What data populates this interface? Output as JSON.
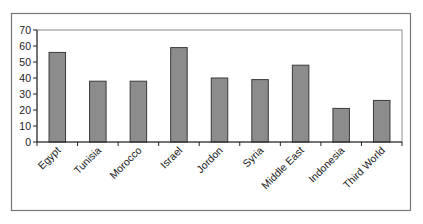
{
  "chart_data": {
    "type": "bar",
    "title": "",
    "xlabel": "",
    "ylabel": "",
    "categories": [
      "Egypt",
      "Tunisia",
      "Morocco",
      "Israel",
      "Jordon",
      "Syria",
      "Middle East",
      "Indonesia",
      "Third World"
    ],
    "values": [
      56,
      38,
      38,
      59,
      40,
      39,
      48,
      21,
      26
    ],
    "ylim": [
      0,
      70
    ],
    "yticks": [
      0,
      10,
      20,
      30,
      40,
      50,
      60,
      70
    ],
    "grid": false,
    "legend": "none",
    "bar_color": "#8c8c8c",
    "bar_edge_color": "#3a3a3a",
    "x_label_rotation": "-45deg"
  }
}
